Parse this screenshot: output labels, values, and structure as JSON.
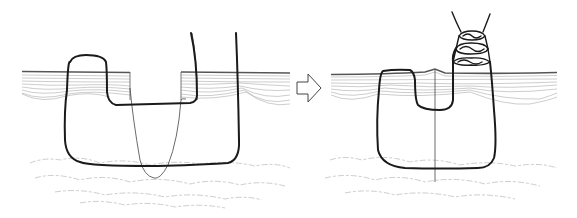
{
  "figure": {
    "description": "Two-panel line drawing of a vertical mattress suture: before tying (left) and after tying (right)",
    "panels": [
      {
        "id": "before",
        "label": ""
      },
      {
        "id": "after",
        "label": ""
      }
    ],
    "arrow": {
      "direction": "right",
      "label": ""
    },
    "colors": {
      "suture": "#1a1a1a",
      "skin_lines": "#9a9a9a",
      "subcutaneous": "#b8b8b8",
      "background": "#ffffff"
    }
  }
}
